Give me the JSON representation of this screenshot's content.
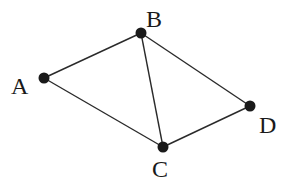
{
  "diagram": {
    "type": "graph",
    "width": 288,
    "height": 187,
    "colors": {
      "edge": "#2a2a2a",
      "node": "#1a1a1a",
      "label": "#1a1a1a",
      "background": "#ffffff"
    },
    "nodes": [
      {
        "id": "A",
        "label": "A",
        "x": 44,
        "y": 78,
        "label_x": 11,
        "label_y": 94
      },
      {
        "id": "B",
        "label": "B",
        "x": 141,
        "y": 33,
        "label_x": 146,
        "label_y": 27
      },
      {
        "id": "C",
        "label": "C",
        "x": 163,
        "y": 147,
        "label_x": 152,
        "label_y": 177
      },
      {
        "id": "D",
        "label": "D",
        "x": 250,
        "y": 106,
        "label_x": 259,
        "label_y": 133
      }
    ],
    "edges": [
      {
        "from": "A",
        "to": "B"
      },
      {
        "from": "A",
        "to": "C"
      },
      {
        "from": "B",
        "to": "C"
      },
      {
        "from": "B",
        "to": "D"
      },
      {
        "from": "C",
        "to": "D"
      }
    ]
  }
}
